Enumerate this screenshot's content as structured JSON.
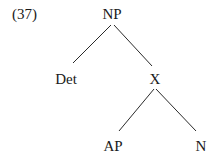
{
  "example_number": "(37)",
  "tree": {
    "root": {
      "label": "NP",
      "x": 112,
      "y": 19
    },
    "nodes": [
      {
        "id": "det",
        "label": "Det",
        "x": 66,
        "y": 84
      },
      {
        "id": "x",
        "label": "X",
        "x": 155,
        "y": 84
      },
      {
        "id": "ap",
        "label": "AP",
        "x": 113,
        "y": 151
      },
      {
        "id": "n",
        "label": "N",
        "x": 201,
        "y": 151
      }
    ],
    "edges": [
      {
        "from": "NP",
        "to": "Det",
        "x1": 111,
        "y1": 25,
        "x2": 73,
        "y2": 63
      },
      {
        "from": "NP",
        "to": "X",
        "x1": 114,
        "y1": 25,
        "x2": 152,
        "y2": 66
      },
      {
        "from": "X",
        "to": "AP",
        "x1": 154,
        "y1": 89,
        "x2": 119,
        "y2": 131
      },
      {
        "from": "X",
        "to": "N",
        "x1": 156,
        "y1": 89,
        "x2": 196,
        "y2": 131
      }
    ]
  }
}
